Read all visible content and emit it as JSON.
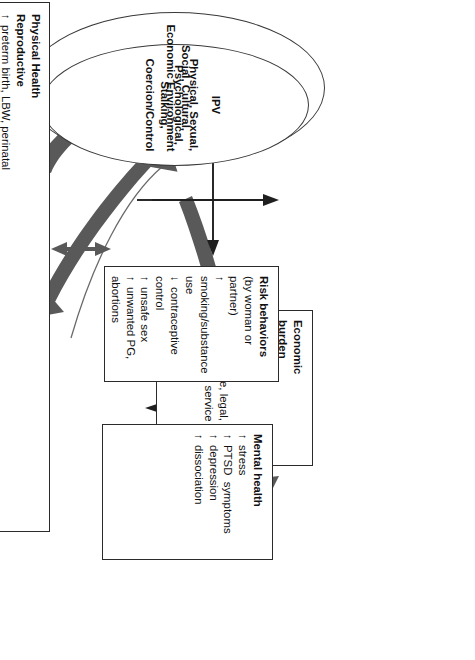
{
  "figure": {
    "type": "conceptual-flow-diagram",
    "orientation": "rotated-90",
    "colors": {
      "box_border": "#2b2b2b",
      "ellipse_border": "#3a3a3a",
      "thick_arrow": "#595959",
      "thin_arrow": "#1f1f1f",
      "background": "#ffffff",
      "text": "#111111"
    }
  },
  "ellipses": {
    "outer": {
      "label": "Social, Cultural,\nEconomic Environment"
    },
    "inner": {
      "acronym": "IPV",
      "label": "Physical, Sexual,\nPsychological, Stalking,\nCoercion/Control"
    }
  },
  "boxes": {
    "economic_burden": {
      "title": "Economic",
      "title2": "burden",
      "items": [
        {
          "arrow": "↓",
          "text": "income"
        },
        {
          "arrow": "↑",
          "text": "divorce"
        },
        {
          "arrow": "↑",
          "text": "poverty"
        },
        {
          "arrow": "↑",
          "text": "health care, legal,"
        },
        {
          "arrow": "",
          "text": "and social service costs"
        }
      ]
    },
    "risk_behaviors": {
      "title": "Risk behaviors",
      "subtitle": "(by woman or partner)",
      "items": [
        {
          "arrow": "↑",
          "text": "smoking/substance use"
        },
        {
          "arrow": "↓",
          "text": "contraceptive control"
        },
        {
          "arrow": "↑",
          "text": "unsafe sex"
        },
        {
          "arrow": "↑",
          "text": "unwanted PG, abortions"
        }
      ]
    },
    "mental_health": {
      "title": "Mental health",
      "items": [
        {
          "arrow": "↑",
          "text": "stress"
        },
        {
          "arrow": "↑",
          "text": "PTSD  symptoms"
        },
        {
          "arrow": "↑",
          "text": "depression"
        },
        {
          "arrow": "↑",
          "text": "dissociation"
        }
      ]
    },
    "physical_health": {
      "title": "Physical Health",
      "groups": [
        {
          "heading": "Reproductive",
          "items": [
            {
              "arrow": "↑",
              "text": "preterm birth, LBW, perinatal"
            },
            {
              "arrow": "",
              "text": "death"
            },
            {
              "arrow": "↑",
              "text": "maternal and infant"
            },
            {
              "arrow": "",
              "text": "complications"
            }
          ]
        },
        {
          "heading": "Gynecologic",
          "items": [
            {
              "arrow": "↑",
              "text": "STI, UTI, infertility, pelvic pain,"
            },
            {
              "arrow": "",
              "text": "dysmenorrhea, dyspareunia"
            },
            {
              "arrow": "↓",
              "text": "sexual pleasure"
            }
          ]
        },
        {
          "heading": "Chronic Disease",
          "items": [
            {
              "arrow": "↑",
              "text": "cancer, CVD, diabetes, obesity,"
            },
            {
              "arrow": "",
              "text": "hypertension,  stroke"
            },
            {
              "arrow": "↑",
              "text": "chronic fatigue,  fibromyalgia"
            },
            {
              "arrow": "↑",
              "text": "disability"
            },
            {
              "arrow": "↓",
              "text": "quality of life"
            }
          ]
        }
      ]
    }
  },
  "connections": [
    {
      "from": "ipv-ellipse",
      "to": "economic-burden",
      "style": "thick-curved",
      "heads": 1
    },
    {
      "from": "ipv-ellipse",
      "to": "physical-health",
      "style": "thick-curved",
      "heads": 1
    },
    {
      "from": "physical-health",
      "to": "ipv-ellipse",
      "style": "thick-curved",
      "heads": 1
    },
    {
      "from": "ipv-ellipse",
      "to": "mental-health",
      "style": "thick-curved",
      "heads": 1
    },
    {
      "from": "ipv-ellipse",
      "to": "risk-behaviors",
      "style": "thin",
      "heads": 1
    },
    {
      "from": "risk-behaviors",
      "to": "economic-burden",
      "style": "thin",
      "heads": 1
    },
    {
      "from": "risk-behaviors",
      "to": "physical-health",
      "style": "thin",
      "heads": 1
    },
    {
      "from": "risk-behaviors",
      "to": "mental-health",
      "style": "thick-short",
      "heads": 1
    },
    {
      "from": "mental-health",
      "to": "physical-health",
      "style": "thick-short",
      "heads": 2
    },
    {
      "from": "physical-health",
      "to": "economic-burden",
      "style": "thin",
      "heads": 1
    }
  ]
}
